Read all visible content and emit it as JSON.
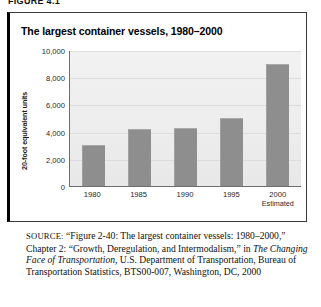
{
  "figure_label": "FIGURE 4.1",
  "chart_title": "The largest container vessels, 1980–2000",
  "chart_data": {
    "type": "bar",
    "title": "The largest container vessels, 1980–2000",
    "xlabel": "",
    "ylabel": "20-foot equivalent units",
    "categories": [
      "1980",
      "1985",
      "1990",
      "1995",
      "2000"
    ],
    "category_notes": [
      "",
      "",
      "",
      "",
      "Estimated"
    ],
    "values": [
      3000,
      4200,
      4300,
      5000,
      9000
    ],
    "ylim": [
      0,
      10000
    ],
    "yticks": [
      0,
      2000,
      4000,
      6000,
      8000,
      10000
    ],
    "ytick_labels": [
      "0",
      "2,000",
      "4,000",
      "6,000",
      "8,000",
      "10,000"
    ],
    "grid": true,
    "legend": "none",
    "bar_color": "#8e8e8e",
    "plot_background": "#eeeeee"
  },
  "source": {
    "label": "SOURCE:",
    "text": " “Figure 2-40: The largest container vessels: 1980–2000,” Chapter 2: “Growth, Deregulation, and Intermodalism,” in ",
    "italic_title": "The Changing Face of Transportation,",
    "text_after": " U.S. Department of Transportation, Bureau of Transportation Statistics, BTS00-007, Washington, DC, 2000"
  }
}
